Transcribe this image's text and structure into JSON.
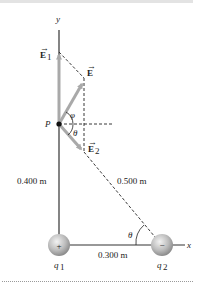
{
  "figure": {
    "axes": {
      "x_label": "x",
      "y_label": "y"
    },
    "point": {
      "label": "P"
    },
    "vectors": {
      "E1": {
        "symbol": "E",
        "subscript": "1"
      },
      "E": {
        "symbol": "E",
        "subscript": ""
      },
      "E2": {
        "symbol": "E",
        "subscript": "2"
      }
    },
    "angles": {
      "phi": "φ",
      "theta_at_P": "θ",
      "theta_at_q2": "θ"
    },
    "distances": {
      "vertical": "0.400 m",
      "hypotenuse": "0.500 m",
      "horizontal": "0.300 m"
    },
    "charges": [
      {
        "name": "q",
        "subscript": "1",
        "sign": "+"
      },
      {
        "name": "q",
        "subscript": "2",
        "sign": "−"
      }
    ],
    "colors": {
      "vector_arrow": "#a9a9a9",
      "axis": "#333333",
      "dashed": "#222222",
      "charge_fill": "#bdbdbd",
      "topbar": "#e3e3e3"
    }
  }
}
